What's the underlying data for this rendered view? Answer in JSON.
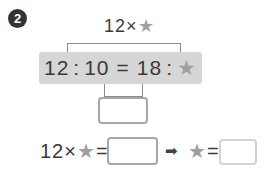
{
  "problem": {
    "number": "2",
    "top_expression": {
      "left": "12×",
      "star": "★"
    },
    "ratio": {
      "a": "12",
      "colon1": ":",
      "b": "10",
      "equals": "=",
      "c": "18",
      "colon2": ":",
      "star": "★"
    },
    "bottom_row": {
      "left": "12×",
      "star1": "★",
      "equals1": "=",
      "arrow": "➡",
      "star2": "★",
      "equals2": "="
    }
  },
  "colors": {
    "badge": "#333333",
    "highlight_box": "#d6d6d6",
    "star": "#a0a0a0",
    "answer_border": "#a8a8a8"
  }
}
